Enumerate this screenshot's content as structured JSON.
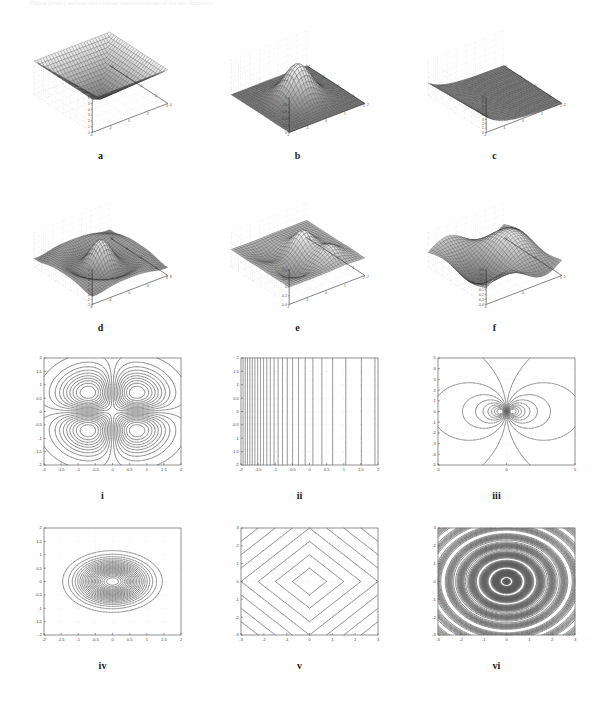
{
  "figure": {
    "ghost_caption": "Figure  (cont.)  surface and contour representations of the test functions",
    "background": "#ffffff",
    "line_color": "#404040",
    "mesh_color": "#2b2b2b",
    "grid_color": "#c8c8c8"
  },
  "surface_panels": [
    {
      "id": "a",
      "label": "a",
      "row": 0,
      "col": 0,
      "kind": "surface-pyramid",
      "xlim": [
        -4,
        4
      ],
      "ylim": [
        -4,
        4
      ],
      "zlim": [
        0,
        6
      ],
      "xticks": [
        "-4",
        "-2",
        "0",
        "2",
        "4"
      ],
      "yticks": [
        "-4",
        "-2",
        "0",
        "2",
        "4"
      ],
      "zticks": [
        "0",
        "1",
        "2",
        "3",
        "4",
        "5",
        "6"
      ]
    },
    {
      "id": "b",
      "label": "b",
      "row": 0,
      "col": 1,
      "kind": "surface-gaussian",
      "xlim": [
        -2,
        2
      ],
      "ylim": [
        -2,
        2
      ],
      "zlim": [
        0,
        1
      ],
      "xticks": [
        "-2",
        "-1",
        "0",
        "1",
        "2"
      ],
      "yticks": [
        "-2",
        "-1",
        "0",
        "1",
        "2"
      ],
      "zticks": [
        "0",
        "0.2",
        "0.4",
        "0.6",
        "0.8",
        "1"
      ]
    },
    {
      "id": "c",
      "label": "c",
      "row": 0,
      "col": 2,
      "kind": "surface-expdecay",
      "xlim": [
        -2,
        2
      ],
      "ylim": [
        -2,
        2
      ],
      "zlim": [
        0,
        8
      ],
      "xticks": [
        "-2",
        "-1",
        "0",
        "1",
        "2"
      ],
      "yticks": [
        "-2",
        "-1",
        "0",
        "1",
        "2"
      ],
      "zticks": [
        "0",
        "1",
        "2",
        "3",
        "4",
        "5",
        "6",
        "7",
        "8"
      ]
    },
    {
      "id": "d",
      "label": "d",
      "row": 1,
      "col": 0,
      "kind": "surface-sombrero",
      "xlim": [
        -8,
        8
      ],
      "ylim": [
        -8,
        8
      ],
      "zlim": [
        -2,
        5
      ],
      "xticks": [
        "-8",
        "-4",
        "0",
        "4",
        "8"
      ],
      "yticks": [
        "-8",
        "-4",
        "0",
        "4",
        "8"
      ],
      "zticks": [
        "-2",
        "-1",
        "0",
        "1",
        "2",
        "3",
        "4",
        "5"
      ]
    },
    {
      "id": "e",
      "label": "e",
      "row": 1,
      "col": 1,
      "kind": "surface-peaks",
      "xlim": [
        -2,
        2
      ],
      "ylim": [
        -2,
        2
      ],
      "zlim": [
        -0.4,
        0.4
      ],
      "xticks": [
        "-2",
        "-1",
        "0",
        "1",
        "2"
      ],
      "yticks": [
        "-2",
        "-1",
        "0",
        "1",
        "2"
      ],
      "zticks": [
        "-0.4",
        "-0.2",
        "0",
        "0.2",
        "0.4"
      ]
    },
    {
      "id": "f",
      "label": "f",
      "row": 1,
      "col": 2,
      "kind": "surface-saddlewave",
      "xlim": [
        -5,
        5
      ],
      "ylim": [
        -5,
        5
      ],
      "zlim": [
        -0.4,
        0.3
      ],
      "xticks": [
        "-5",
        "0",
        "5"
      ],
      "yticks": [
        "-5",
        "0",
        "5"
      ],
      "zticks": [
        "0.3",
        "0.2",
        "0.1",
        "0",
        "-0.1",
        "-0.2",
        "-0.3",
        "-0.4"
      ]
    }
  ],
  "contour_panels": [
    {
      "id": "i",
      "label": "i",
      "row": 0,
      "col": 0,
      "kind": "contour-quadrupole",
      "xlim": [
        -2,
        2
      ],
      "ylim": [
        -2,
        2
      ],
      "xticks": [
        "-2",
        "-1.5",
        "-1",
        "-0.5",
        "0",
        "0.5",
        "1",
        "1.5",
        "2"
      ],
      "yticks": [
        "-2",
        "-1.5",
        "-1",
        "-0.5",
        "0",
        "0.5",
        "1",
        "1.5",
        "2"
      ],
      "levels": 20,
      "grid": true
    },
    {
      "id": "ii",
      "label": "ii",
      "row": 0,
      "col": 1,
      "kind": "contour-verticals",
      "xlim": [
        -2,
        2
      ],
      "ylim": [
        -2,
        2
      ],
      "xticks": [
        "-2",
        "-1.5",
        "-1",
        "-0.5",
        "0",
        "0.5",
        "1",
        "1.5",
        "2"
      ],
      "yticks": [
        "-2",
        "-1.5",
        "-1",
        "-0.5",
        "0",
        "0.5",
        "1",
        "1.5",
        "2"
      ],
      "levels": 24,
      "grid": true
    },
    {
      "id": "iii",
      "label": "iii",
      "row": 0,
      "col": 2,
      "kind": "contour-dipole",
      "xlim": [
        -5,
        5
      ],
      "ylim": [
        -5,
        5
      ],
      "xticks": [
        "-5",
        "0",
        "5"
      ],
      "yticks": [
        "-5",
        "-4",
        "-3",
        "-2",
        "-1",
        "0",
        "1",
        "2",
        "3",
        "4",
        "5"
      ],
      "levels": 18,
      "grid": true
    },
    {
      "id": "iv",
      "label": "iv",
      "row": 1,
      "col": 0,
      "kind": "contour-ellipses",
      "xlim": [
        -2,
        2
      ],
      "ylim": [
        -2,
        2
      ],
      "xticks": [
        "-2",
        "-1.5",
        "-1",
        "-0.5",
        "0",
        "0.5",
        "1",
        "1.5",
        "2"
      ],
      "yticks": [
        "-2",
        "-1.5",
        "-1",
        "-0.5",
        "0",
        "0.5",
        "1",
        "1.5",
        "2"
      ],
      "levels": 22,
      "grid": true
    },
    {
      "id": "v",
      "label": "v",
      "row": 1,
      "col": 1,
      "kind": "contour-diamonds",
      "xlim": [
        -3,
        3
      ],
      "ylim": [
        -3,
        3
      ],
      "xticks": [
        "-3",
        "-2",
        "-1",
        "0",
        "1",
        "2",
        "3"
      ],
      "yticks": [
        "-3",
        "-2",
        "-1",
        "0",
        "1",
        "2",
        "3"
      ],
      "levels": 7,
      "grid": true
    },
    {
      "id": "vi",
      "label": "vi",
      "row": 1,
      "col": 2,
      "kind": "contour-rings",
      "xlim": [
        -3,
        3
      ],
      "ylim": [
        -3,
        3
      ],
      "xticks": [
        "-3",
        "-2",
        "-1",
        "0",
        "1",
        "2",
        "3"
      ],
      "yticks": [
        "-3",
        "-2",
        "-1",
        "0",
        "1",
        "2",
        "3"
      ],
      "levels": 34,
      "grid": true
    }
  ]
}
